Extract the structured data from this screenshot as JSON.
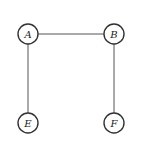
{
  "diagram": {
    "type": "graph",
    "nodes": [
      {
        "id": "A",
        "label": "A",
        "x": 28,
        "y": 34
      },
      {
        "id": "B",
        "label": "B",
        "x": 114,
        "y": 34
      },
      {
        "id": "E",
        "label": "E",
        "x": 28,
        "y": 123
      },
      {
        "id": "F",
        "label": "F",
        "x": 114,
        "y": 123
      }
    ],
    "edges": [
      {
        "from": "A",
        "to": "B"
      },
      {
        "from": "A",
        "to": "E"
      },
      {
        "from": "B",
        "to": "F"
      }
    ],
    "node_radius": 10
  }
}
